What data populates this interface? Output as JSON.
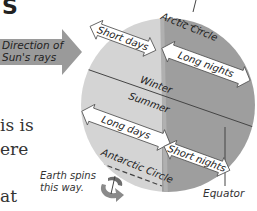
{
  "figure": {
    "title_fragment": "S",
    "left_text_fragments": [
      "is is",
      "ere",
      "at"
    ],
    "sun_direction_label": "Direction of Sun's rays",
    "sun_direction_lines": [
      "Direction of",
      "Sun's rays"
    ],
    "spin_label_lines": [
      "Earth spins",
      "this way."
    ],
    "equator_label": "Equator",
    "labels": {
      "arctic_circle": "Arctic Circle",
      "antarctic_circle": "Antarctic Circle",
      "short_days": "Short days",
      "long_nights": "Long nights",
      "long_days": "Long days",
      "short_nights": "Short nights",
      "winter": "Winter",
      "summer": "Summer"
    },
    "colors": {
      "day_side": "#d4d4d4",
      "night_side": "#9e9e9e",
      "sun_arrow": "#9a9a9a",
      "arrow_fill": "#ffffff",
      "line": "#444444"
    }
  }
}
